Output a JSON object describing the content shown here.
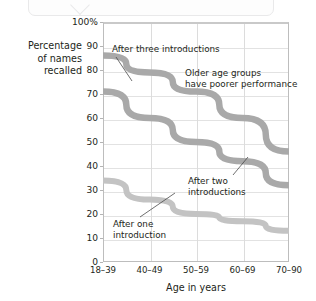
{
  "axes": {
    "ylabel": "Percentage\nof names\nrecalled",
    "ylabel_line1": "Percentage",
    "ylabel_line2": "of names",
    "ylabel_line3": "recalled",
    "xlabel": "Age in years",
    "yticks": [
      "100%",
      "90",
      "80",
      "70",
      "60",
      "50",
      "40",
      "30",
      "20",
      "10",
      "0"
    ],
    "xticks": [
      "18–39",
      "40–49",
      "50–59",
      "60–69",
      "70–90"
    ]
  },
  "annotations": {
    "three": "After three introductions",
    "older_line1": "Older age groups",
    "older_line2": "have poorer performance",
    "two_line1": "After two",
    "two_line2": "introductions",
    "one_line1": "After one",
    "one_line2": "introduction"
  },
  "colors": {
    "line": "#a9a9a9",
    "line_light": "#c3c3c3",
    "grid": "#dedede",
    "frame": "#bdbdbd",
    "text": "#231f20",
    "bubble_border": "#e9e9ea"
  },
  "chart_data": {
    "type": "line",
    "title": "",
    "subtitle": "",
    "xlabel": "Age in years",
    "ylabel": "Percentage of names recalled",
    "categories": [
      "18–39",
      "40–49",
      "50–59",
      "60–69",
      "70–90"
    ],
    "ylim": [
      0,
      100
    ],
    "ytick_values": [
      0,
      10,
      20,
      30,
      40,
      50,
      60,
      70,
      80,
      90,
      100
    ],
    "grid": true,
    "legend": "none",
    "series": [
      {
        "name": "After three introductions",
        "values": [
          86,
          79,
          71,
          60,
          46
        ]
      },
      {
        "name": "After two introductions",
        "values": [
          71,
          60,
          50,
          42,
          32
        ]
      },
      {
        "name": "After one introduction",
        "values": [
          34,
          26,
          20,
          17,
          13
        ]
      }
    ],
    "annotations": [
      "After three introductions",
      "Older age groups have poorer performance",
      "After two introductions",
      "After one introduction"
    ]
  }
}
